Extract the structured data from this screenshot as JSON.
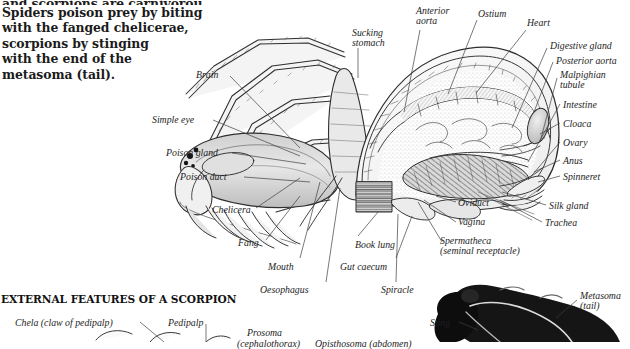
{
  "page": {
    "width": 630,
    "height": 342,
    "background": "#ffffff",
    "ink": "#1d1d1d",
    "leader_color": "#4a4a4a"
  },
  "intro": {
    "lines": [
      "and scorpions are carnivorous.",
      "Spiders poison prey by biting",
      "with the fanged chelicerae,",
      "scorpions by stinging",
      "with the end of the",
      "metasoma (tail)."
    ]
  },
  "section_heading": "EXTERNAL FEATURES OF A SCORPION",
  "figure_spider": {
    "title": "Internal anatomy of a spider",
    "labels": [
      {
        "id": "sucking-stomach",
        "text": "Sucking\nstomach",
        "x": 352,
        "y": 28,
        "align": "left"
      },
      {
        "id": "anterior-aorta",
        "text": "Anterior\naorta",
        "x": 416,
        "y": 6,
        "align": "left"
      },
      {
        "id": "ostium",
        "text": "Ostium",
        "x": 478,
        "y": 9,
        "align": "left"
      },
      {
        "id": "heart",
        "text": "Heart",
        "x": 527,
        "y": 18,
        "align": "left"
      },
      {
        "id": "digestive-gland",
        "text": "Digestive gland",
        "x": 550,
        "y": 41,
        "align": "left"
      },
      {
        "id": "posterior-aorta",
        "text": "Posterior aorta",
        "x": 556,
        "y": 56,
        "align": "left"
      },
      {
        "id": "malpighian-tubule",
        "text": "Malpighian\ntubule",
        "x": 560,
        "y": 70,
        "align": "left"
      },
      {
        "id": "intestine",
        "text": "Intestine",
        "x": 563,
        "y": 100,
        "align": "left"
      },
      {
        "id": "cloaca",
        "text": "Cloaca",
        "x": 563,
        "y": 119,
        "align": "left"
      },
      {
        "id": "ovary",
        "text": "Ovary",
        "x": 563,
        "y": 138,
        "align": "left"
      },
      {
        "id": "anus",
        "text": "Anus",
        "x": 563,
        "y": 156,
        "align": "left"
      },
      {
        "id": "spinneret",
        "text": "Spinneret",
        "x": 563,
        "y": 172,
        "align": "left"
      },
      {
        "id": "silk-gland",
        "text": "Silk gland",
        "x": 549,
        "y": 201,
        "align": "left"
      },
      {
        "id": "trachea",
        "text": "Trachea",
        "x": 545,
        "y": 218,
        "align": "left"
      },
      {
        "id": "brain",
        "text": "Brain",
        "x": 196,
        "y": 70,
        "align": "right"
      },
      {
        "id": "simple-eye",
        "text": "Simple eye",
        "x": 152,
        "y": 115,
        "align": "right"
      },
      {
        "id": "poison-gland",
        "text": "Poison gland",
        "x": 166,
        "y": 148,
        "align": "right"
      },
      {
        "id": "poison-duct",
        "text": "Poison duct",
        "x": 180,
        "y": 172,
        "align": "right"
      },
      {
        "id": "chelicera",
        "text": "Chelicera",
        "x": 212,
        "y": 205,
        "align": "right"
      },
      {
        "id": "fang",
        "text": "Fang",
        "x": 238,
        "y": 238,
        "align": "right"
      },
      {
        "id": "mouth",
        "text": "Mouth",
        "x": 268,
        "y": 262,
        "align": "right"
      },
      {
        "id": "oesophagus",
        "text": "Oesophagus",
        "x": 260,
        "y": 285,
        "align": "right"
      },
      {
        "id": "book-lung",
        "text": "Book lung",
        "x": 355,
        "y": 240,
        "align": "left"
      },
      {
        "id": "gut-caecum",
        "text": "Gut caecum",
        "x": 340,
        "y": 262,
        "align": "left"
      },
      {
        "id": "spiracle",
        "text": "Spiracle",
        "x": 381,
        "y": 285,
        "align": "left"
      },
      {
        "id": "oviduct",
        "text": "Oviduct",
        "x": 458,
        "y": 198,
        "align": "left"
      },
      {
        "id": "vagina",
        "text": "Vagina",
        "x": 458,
        "y": 217,
        "align": "left"
      },
      {
        "id": "spermatheca",
        "text": "Spermatheca\n(seminal receptacle)",
        "x": 440,
        "y": 236,
        "align": "left"
      }
    ]
  },
  "figure_scorpion": {
    "labels": [
      {
        "id": "chela",
        "text": "Chela (claw of pedipalp)",
        "x": 15,
        "y": 318,
        "align": "left"
      },
      {
        "id": "pedipalp",
        "text": "Pedipalp",
        "x": 168,
        "y": 318,
        "align": "left"
      },
      {
        "id": "prosoma",
        "text": "Prosoma",
        "x": 247,
        "y": 328,
        "align": "left"
      },
      {
        "id": "prosoma-sub",
        "text": "(cephalothorax)",
        "x": 237,
        "y": 339,
        "align": "left"
      },
      {
        "id": "opisthosoma",
        "text": "Opisthosoma (abdomen)",
        "x": 315,
        "y": 339,
        "align": "left"
      },
      {
        "id": "sting",
        "text": "Sting",
        "x": 430,
        "y": 318,
        "align": "left"
      },
      {
        "id": "metasoma",
        "text": "Metasoma\n(tail)",
        "x": 580,
        "y": 291,
        "align": "left"
      }
    ]
  },
  "icons": {
    "spider_figure": "spider-anatomy-engraving",
    "scorpion_figure": "scorpion-photograph"
  }
}
